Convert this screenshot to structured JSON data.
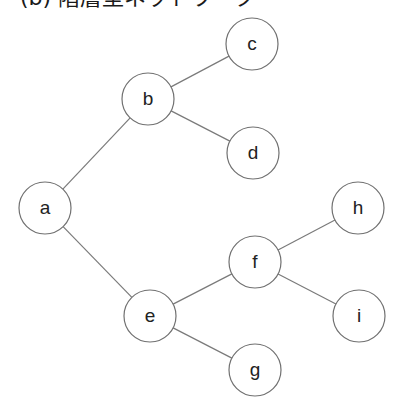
{
  "title": "(b) 階層型ネットワーク",
  "diagram": {
    "type": "tree",
    "node_radius": 26,
    "colors": {
      "edge": "#7a7a7a",
      "node_stroke": "#707070",
      "node_fill": "#ffffff",
      "label": "#222222"
    },
    "nodes": [
      {
        "id": "a",
        "label": "a",
        "x": 45,
        "y": 208
      },
      {
        "id": "b",
        "label": "b",
        "x": 148,
        "y": 99
      },
      {
        "id": "c",
        "label": "c",
        "x": 252,
        "y": 44
      },
      {
        "id": "d",
        "label": "d",
        "x": 253,
        "y": 153
      },
      {
        "id": "e",
        "label": "e",
        "x": 150,
        "y": 316
      },
      {
        "id": "f",
        "label": "f",
        "x": 255,
        "y": 262
      },
      {
        "id": "g",
        "label": "g",
        "x": 255,
        "y": 370
      },
      {
        "id": "h",
        "label": "h",
        "x": 358,
        "y": 208
      },
      {
        "id": "i",
        "label": "i",
        "x": 359,
        "y": 316
      }
    ],
    "edges": [
      {
        "from": "a",
        "to": "b"
      },
      {
        "from": "b",
        "to": "c"
      },
      {
        "from": "b",
        "to": "d"
      },
      {
        "from": "a",
        "to": "e"
      },
      {
        "from": "e",
        "to": "f"
      },
      {
        "from": "e",
        "to": "g"
      },
      {
        "from": "f",
        "to": "h"
      },
      {
        "from": "f",
        "to": "i"
      }
    ]
  }
}
